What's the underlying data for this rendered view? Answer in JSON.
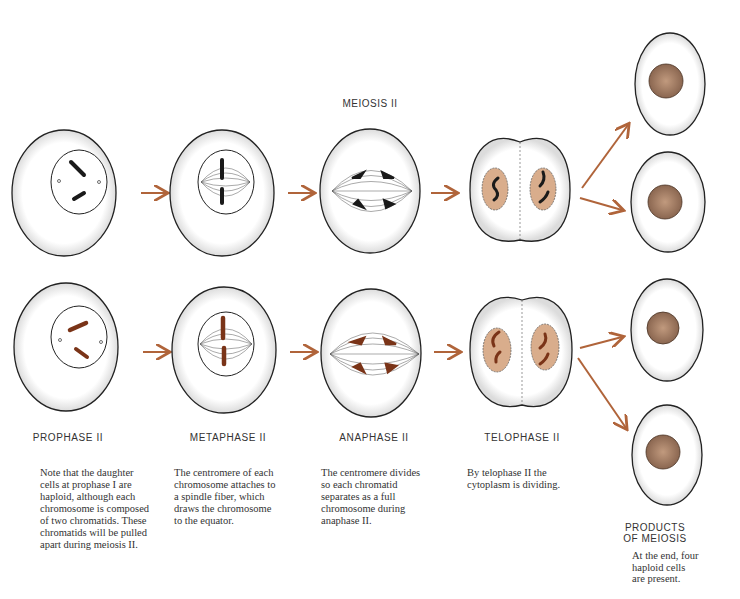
{
  "title": "MEIOSIS II",
  "colors": {
    "arrow": "#b0643a",
    "chromosome_row1": "#1a1a1a",
    "chromosome_row2": "#7a3418",
    "nucleus_fill": "#d9ad8c",
    "haploid_nucleus": "#a88268",
    "cell_outline": "#222222"
  },
  "stages": [
    {
      "label": "PROPHASE II",
      "description": "Note that the daughter cells at prophase I are haploid, although each chromosome is composed of two chromatids. These chromatids will be pulled apart during meiosis II.",
      "lines": [
        "Note that the daughter",
        "cells at prophase I are",
        "haploid, although each",
        "chromosome is composed",
        "of two chromatids. These",
        "chromatids will be pulled",
        "apart during meiosis II."
      ]
    },
    {
      "label": "METAPHASE II",
      "description": "The centromere of each chromosome attaches to a spindle fiber, which draws the chromosome to the equator.",
      "lines": [
        "The centromere of each",
        "chromosome attaches to",
        "a spindle fiber, which",
        "draws the chromosome",
        "to the equator."
      ]
    },
    {
      "label": "ANAPHASE II",
      "description": "The centromere divides so each chromatid separates as a full chromosome during anaphase II.",
      "lines": [
        "The centromere divides",
        "so each chromatid",
        "separates as a  full",
        "chromosome during",
        "anaphase II."
      ]
    },
    {
      "label": "TELOPHASE II",
      "description": "By telophase II the cytoplasm is dividing.",
      "lines": [
        "By telophase II the",
        "cytoplasm  is dividing."
      ]
    }
  ],
  "products": {
    "label_line1": "PRODUCTS",
    "label_line2": "OF MEIOSIS",
    "lines": [
      "At the end, four",
      "haploid cells",
      "are present."
    ],
    "cell_count": 4
  }
}
